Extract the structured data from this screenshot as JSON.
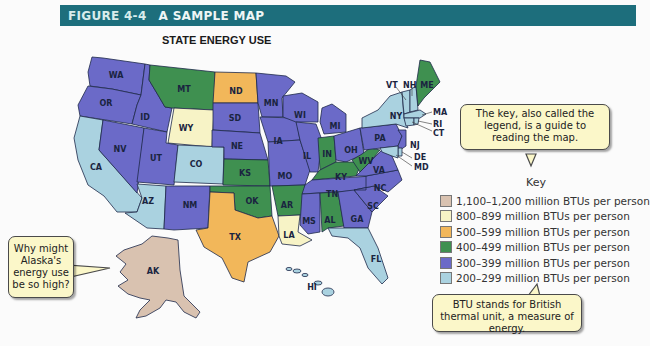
{
  "header": {
    "figure_number": "FIGURE 4-4",
    "figure_title": "A SAMPLE MAP",
    "bar_color": "#1d6e7c"
  },
  "map": {
    "title": "STATE ENERGY USE",
    "states": [
      {
        "code": "WA",
        "category": "300-399"
      },
      {
        "code": "OR",
        "category": "300-399"
      },
      {
        "code": "CA",
        "category": "200-299"
      },
      {
        "code": "ID",
        "category": "300-399"
      },
      {
        "code": "NV",
        "category": "300-399"
      },
      {
        "code": "MT",
        "category": "400-499"
      },
      {
        "code": "WY",
        "category": "800-899"
      },
      {
        "code": "UT",
        "category": "300-399"
      },
      {
        "code": "CO",
        "category": "200-299"
      },
      {
        "code": "AZ",
        "category": "200-299"
      },
      {
        "code": "NM",
        "category": "300-399"
      },
      {
        "code": "ND",
        "category": "500-599"
      },
      {
        "code": "SD",
        "category": "300-399"
      },
      {
        "code": "NE",
        "category": "300-399"
      },
      {
        "code": "KS",
        "category": "400-499"
      },
      {
        "code": "OK",
        "category": "400-499"
      },
      {
        "code": "TX",
        "category": "500-599"
      },
      {
        "code": "MN",
        "category": "300-399"
      },
      {
        "code": "IA",
        "category": "300-399"
      },
      {
        "code": "MO",
        "category": "300-399"
      },
      {
        "code": "AR",
        "category": "400-499"
      },
      {
        "code": "LA",
        "category": "800-899"
      },
      {
        "code": "WI",
        "category": "300-399"
      },
      {
        "code": "IL",
        "category": "300-399"
      },
      {
        "code": "MI",
        "category": "300-399"
      },
      {
        "code": "IN",
        "category": "400-499"
      },
      {
        "code": "OH",
        "category": "300-399"
      },
      {
        "code": "KY",
        "category": "400-499"
      },
      {
        "code": "TN",
        "category": "300-399"
      },
      {
        "code": "MS",
        "category": "300-399"
      },
      {
        "code": "AL",
        "category": "400-499"
      },
      {
        "code": "GA",
        "category": "300-399"
      },
      {
        "code": "FL",
        "category": "200-299"
      },
      {
        "code": "SC",
        "category": "300-399"
      },
      {
        "code": "NC",
        "category": "300-399"
      },
      {
        "code": "VA",
        "category": "300-399"
      },
      {
        "code": "WV",
        "category": "400-499"
      },
      {
        "code": "PA",
        "category": "300-399"
      },
      {
        "code": "NY",
        "category": "200-299"
      },
      {
        "code": "VT",
        "category": "200-299"
      },
      {
        "code": "NH",
        "category": "200-299"
      },
      {
        "code": "ME",
        "category": "400-499"
      },
      {
        "code": "MA",
        "category": "200-299"
      },
      {
        "code": "RI",
        "category": "200-299"
      },
      {
        "code": "CT",
        "category": "200-299"
      },
      {
        "code": "NJ",
        "category": "300-399"
      },
      {
        "code": "DE",
        "category": "200-299"
      },
      {
        "code": "MD",
        "category": "200-299"
      },
      {
        "code": "AK",
        "category": "1100-1200"
      },
      {
        "code": "HI",
        "category": "200-299"
      }
    ],
    "labels": {
      "WA": "WA",
      "OR": "OR",
      "CA": "CA",
      "ID": "ID",
      "NV": "NV",
      "MT": "MT",
      "WY": "WY",
      "UT": "UT",
      "CO": "CO",
      "AZ": "AZ",
      "NM": "NM",
      "ND": "ND",
      "SD": "SD",
      "NE": "NE",
      "KS": "KS",
      "OK": "OK",
      "TX": "TX",
      "MN": "MN",
      "IA": "IA",
      "MO": "MO",
      "AR": "AR",
      "LA": "LA",
      "WI": "WI",
      "IL": "IL",
      "MI": "MI",
      "IN": "IN",
      "OH": "OH",
      "KY": "KY",
      "TN": "TN",
      "MS": "MS",
      "AL": "AL",
      "GA": "GA",
      "FL": "FL",
      "SC": "SC",
      "NC": "NC",
      "VA": "VA",
      "WV": "WV",
      "PA": "PA",
      "NY": "NY",
      "VT": "VT",
      "NH": "NH",
      "ME": "ME",
      "MA": "MA",
      "RI": "RI",
      "CT": "CT",
      "NJ": "NJ",
      "DE": "DE",
      "MD": "MD",
      "AK": "AK",
      "HI": "HI"
    }
  },
  "legend": {
    "title": "Key",
    "items": [
      {
        "label": "1,100–1,200 million BTUs per person",
        "color": "#d9c2b0"
      },
      {
        "label": "800–899 million BTUs per person",
        "color": "#f7f3c6"
      },
      {
        "label": "500–599 million BTUs per person",
        "color": "#f2b75a"
      },
      {
        "label": "400–499 million BTUs per person",
        "color": "#3f9050"
      },
      {
        "label": "300–399 million BTUs per person",
        "color": "#6b6ac8"
      },
      {
        "label": "200–299 million BTUs per person",
        "color": "#aad2e0"
      }
    ]
  },
  "callouts": {
    "legend_note": "The key, also called the legend, is a guide to reading the map.",
    "alaska_question": "Why might Alaska's energy use be so high?",
    "btu_note": "BTU stands for British thermal unit, a measure of energy."
  }
}
